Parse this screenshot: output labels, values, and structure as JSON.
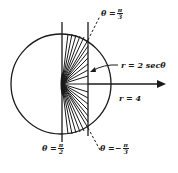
{
  "diagram": {
    "type": "polar-region",
    "colors": {
      "stroke": "#1a1a1a",
      "background": "#ffffff"
    },
    "circle": {
      "label": "r = 4"
    },
    "line": {
      "label": "r = 2 secθ"
    },
    "angles": {
      "top": {
        "prefix": "θ =",
        "sign": "",
        "num": "π",
        "den": "3"
      },
      "bottom_right": {
        "prefix": "θ =",
        "sign": "−",
        "num": "π",
        "den": "3"
      },
      "bottom_left": {
        "prefix": "θ =",
        "sign": "",
        "num": "π",
        "den": "2"
      }
    }
  }
}
